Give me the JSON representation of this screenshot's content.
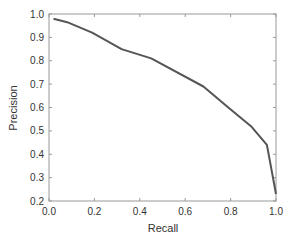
{
  "chart_data": {
    "type": "line",
    "title": "",
    "xlabel": "Recall",
    "ylabel": "Precision",
    "xlim": [
      0.0,
      1.0
    ],
    "ylim": [
      0.2,
      1.0
    ],
    "xticks": [
      "0.0",
      "0.2",
      "0.4",
      "0.6",
      "0.8",
      "1.0"
    ],
    "yticks": [
      "0.2",
      "0.3",
      "0.4",
      "0.5",
      "0.6",
      "0.7",
      "0.8",
      "0.9",
      "1.0"
    ],
    "grid": false,
    "legend": null,
    "series": [
      {
        "name": "precision-recall",
        "color": "#555555",
        "x": [
          0.02,
          0.08,
          0.19,
          0.32,
          0.45,
          0.68,
          0.79,
          0.89,
          0.96,
          1.0
        ],
        "y": [
          0.98,
          0.965,
          0.92,
          0.85,
          0.81,
          0.69,
          0.6,
          0.52,
          0.44,
          0.23
        ]
      }
    ]
  }
}
